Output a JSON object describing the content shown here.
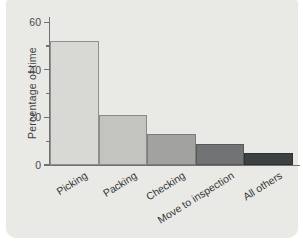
{
  "figure": {
    "page_background": "#ffffff",
    "panel_background": "#e9eae6",
    "axis_color": "#6f7173",
    "tick_label_color": "#4a4b4c",
    "category_label_color": "#353637"
  },
  "chart_data": {
    "type": "bar",
    "categories": [
      "Picking",
      "Packing",
      "Checking",
      "Move to inspection",
      "All others"
    ],
    "values": [
      52,
      21,
      13,
      9,
      5
    ],
    "title": "",
    "xlabel": "",
    "ylabel": "Percentage of time",
    "ylim": [
      0,
      62
    ],
    "yticks_major": [
      0,
      20,
      40,
      60
    ],
    "yticks_minor": [
      10,
      30,
      50
    ],
    "grid": false,
    "legend": "none",
    "bar_gap": 0,
    "bar_fill_colors": [
      "#d8d9d5",
      "#c3c4c0",
      "#a2a3a1",
      "#717374",
      "#3e4143"
    ],
    "bar_border_colors": [
      "#8f918d",
      "#898b87",
      "#7b7d7a",
      "#565859",
      "#2e3133"
    ]
  }
}
